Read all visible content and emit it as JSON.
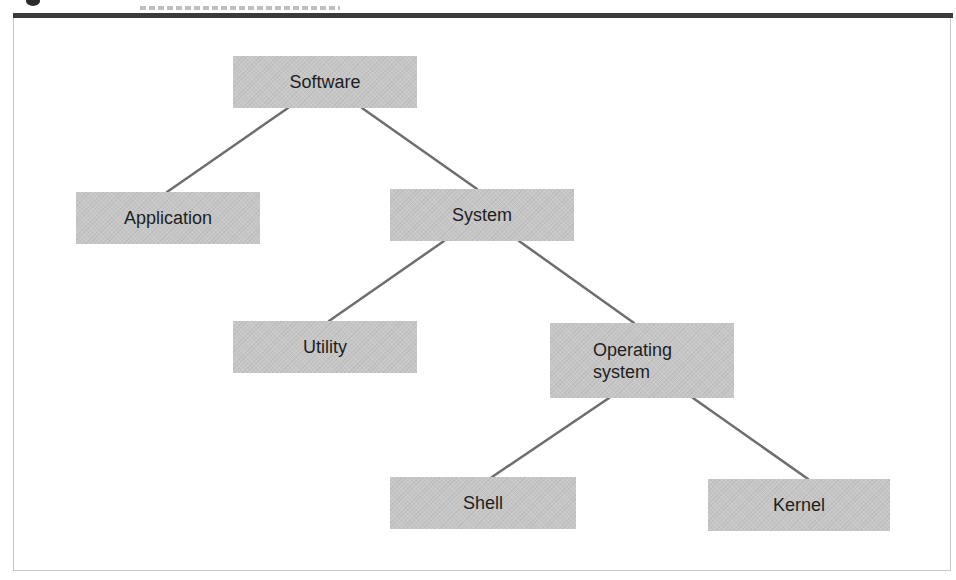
{
  "figure": {
    "caption_visible": false,
    "colors": {
      "node_fill": "#c6c6c6",
      "connector": "#6e6e6e",
      "rule": "#3a3a3a",
      "text": "#1e1e1e"
    }
  },
  "tree": {
    "nodes": [
      {
        "id": "software",
        "label": "Software",
        "level": 0,
        "parent": null
      },
      {
        "id": "application",
        "label": "Application",
        "level": 1,
        "parent": "software"
      },
      {
        "id": "system",
        "label": "System",
        "level": 1,
        "parent": "software"
      },
      {
        "id": "utility",
        "label": "Utility",
        "level": 2,
        "parent": "system"
      },
      {
        "id": "operating-system",
        "label": "Operating\nsystem",
        "level": 2,
        "parent": "system"
      },
      {
        "id": "shell",
        "label": "Shell",
        "level": 3,
        "parent": "operating-system"
      },
      {
        "id": "kernel",
        "label": "Kernel",
        "level": 3,
        "parent": "operating-system"
      }
    ],
    "edges": [
      {
        "from": "software",
        "to": "application"
      },
      {
        "from": "software",
        "to": "system"
      },
      {
        "from": "system",
        "to": "utility"
      },
      {
        "from": "system",
        "to": "operating-system"
      },
      {
        "from": "operating-system",
        "to": "shell"
      },
      {
        "from": "operating-system",
        "to": "kernel"
      }
    ]
  }
}
